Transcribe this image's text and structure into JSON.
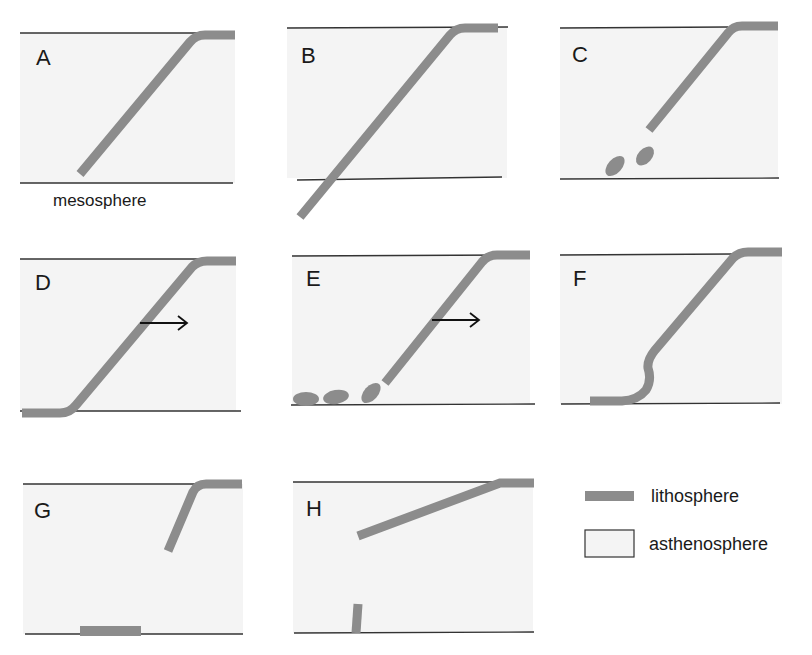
{
  "figure": {
    "type": "subduction slab evolution schematic",
    "panels": [
      {
        "id": "A",
        "label": "A",
        "annotation": "mesosphere"
      },
      {
        "id": "B",
        "label": "B"
      },
      {
        "id": "C",
        "label": "C"
      },
      {
        "id": "D",
        "label": "D"
      },
      {
        "id": "E",
        "label": "E"
      },
      {
        "id": "F",
        "label": "F"
      },
      {
        "id": "G",
        "label": "G"
      },
      {
        "id": "H",
        "label": "H"
      }
    ],
    "legend": {
      "items": [
        {
          "label": "lithosphere",
          "swatch": "gray-bar"
        },
        {
          "label": "asthenosphere",
          "swatch": "light-box"
        }
      ]
    },
    "colors": {
      "slab": "#8c8c8c",
      "asthenosphere": "#f4f4f4",
      "line": "#333333",
      "background": "#ffffff"
    }
  }
}
